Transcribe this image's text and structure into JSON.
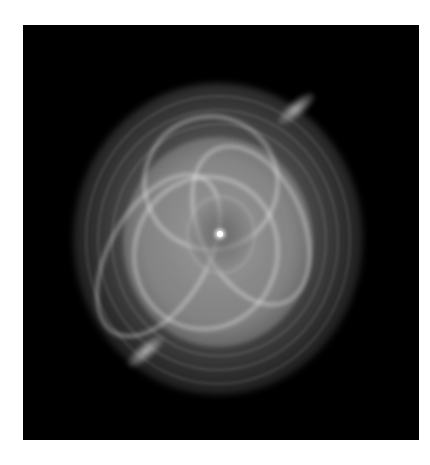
{
  "image": {
    "subject": "planetary nebula with concentric shells, overlapping bright lobes and a central star",
    "background_color": "#000000",
    "border_color": "#ffffff",
    "palette": [
      "#000000",
      "#808080",
      "#c8c8c8",
      "#ffffff"
    ]
  }
}
